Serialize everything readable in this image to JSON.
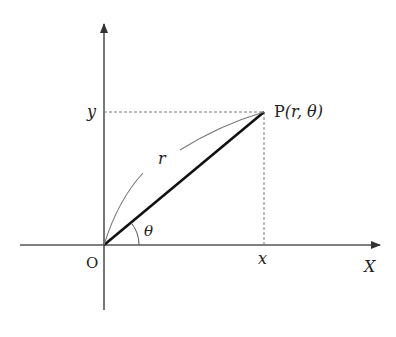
{
  "diagram": {
    "origin_label": "O",
    "x_axis_label": "X",
    "x_tick_label": "x",
    "y_tick_label": "y",
    "point_label_prefix": "P",
    "point_label_args": "(r, θ)",
    "radius_label": "r",
    "angle_label": "θ",
    "colors": {
      "axis": "#555555",
      "radius_segment": "#111111",
      "arc": "#777777",
      "dashed": "#777777",
      "text": "#222222"
    }
  }
}
